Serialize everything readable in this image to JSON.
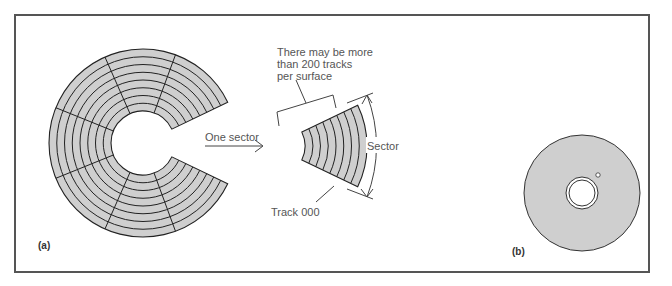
{
  "figure": {
    "panel_a": {
      "label": "(a)",
      "disk": {
        "tracks_drawn": 8,
        "sectors_drawn": 7,
        "fill": "#cfcfcf"
      },
      "annotations": {
        "one_sector": "One sector",
        "tracks_note_line1": "There may be more",
        "tracks_note_line2": "than 200 tracks",
        "tracks_note_line3": "per surface",
        "sector": "Sector",
        "track_000": "Track 000"
      }
    },
    "panel_b": {
      "label": "(b)",
      "disk": {
        "fill": "#cfcfcf"
      }
    }
  }
}
